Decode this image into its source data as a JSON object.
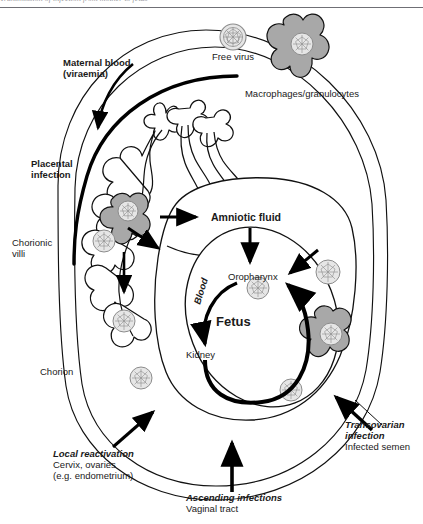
{
  "page": {
    "width": 423,
    "height": 524,
    "background": "#ffffff",
    "cut_off_header_text": "Transmission of infection from mother to fetus",
    "header_rule_color": "#6f6f75"
  },
  "palette": {
    "ink": "#000000",
    "text": "#1a1a1a",
    "cell_gray": "#a8a8a8",
    "virus_gray": "#d9d9d9",
    "virus_mesh": "#8c8c8c",
    "thin_line": "#111111"
  },
  "labels": {
    "free_virus": "Free virus",
    "macrophages": "Macrophages/granulocytes",
    "maternal_blood_l1": "Maternal blood",
    "maternal_blood_l2": "(viraemia)",
    "placental_infection_l1": "Placental",
    "placental_infection_l2": "infection",
    "chorionic_villi_l1": "Chorionic",
    "chorionic_villi_l2": "villi",
    "chorion": "Chorion",
    "amniotic_fluid": "Amniotic fluid",
    "oropharynx": "Oropharynx",
    "fetus": "Fetus",
    "kidney": "Kidney",
    "blood": "Blood",
    "local_reactivation_l1": "Local reactivation",
    "local_reactivation_l2": "Cervix, ovaries",
    "local_reactivation_l3": "(e.g. endometrium)",
    "ascending_l1": "Ascending infections",
    "ascending_l2": "Vaginal tract",
    "transovarian_l1": "Transovarian",
    "transovarian_l2": "infection",
    "transovarian_l3": "Infected semen"
  },
  "icons": {
    "virus": "virus-particle-icon",
    "macrophage": "macrophage-cell-icon",
    "arrow": "arrow-icon"
  },
  "diagram": {
    "type": "biological-pathway-diagram",
    "virus_particles": [
      {
        "id": "free-virus",
        "x": 233,
        "y": 37,
        "r": 13
      },
      {
        "id": "macrophage-virus-top",
        "x": 302,
        "y": 44,
        "r": 11
      },
      {
        "id": "villi-macrophage-virus",
        "x": 128,
        "y": 210,
        "r": 10
      },
      {
        "id": "villi-virus",
        "x": 104,
        "y": 241,
        "r": 11
      },
      {
        "id": "chorion-virus-left",
        "x": 124,
        "y": 321,
        "r": 11
      },
      {
        "id": "chorion-virus-lower-left",
        "x": 141,
        "y": 378,
        "r": 11
      },
      {
        "id": "fetus-virus",
        "x": 258,
        "y": 288,
        "r": 11
      },
      {
        "id": "chorion-virus-right-upper",
        "x": 328,
        "y": 272,
        "r": 12
      },
      {
        "id": "chorion-macrophage-virus-right",
        "x": 331,
        "y": 335,
        "r": 11
      },
      {
        "id": "chorion-virus-right-lower",
        "x": 291,
        "y": 390,
        "r": 11
      }
    ],
    "macrophages": [
      {
        "id": "macrophage-top-right",
        "cx": 303,
        "cy": 47
      },
      {
        "id": "macrophage-villi",
        "cx": 129,
        "cy": 212
      },
      {
        "id": "macrophage-chorion-right",
        "cx": 333,
        "cy": 336
      }
    ],
    "pathways": [
      {
        "name": "maternal-blood-viraemia",
        "label": "Maternal blood (viraemia)",
        "style": "curved-arrow-down-left"
      },
      {
        "name": "placental-infection",
        "label": "Placental infection",
        "style": "label-only"
      },
      {
        "name": "villi-to-amniotic",
        "style": "straight-arrow-right"
      },
      {
        "name": "villi-to-fetus-diagonal",
        "style": "straight-arrow-diagonal"
      },
      {
        "name": "villi-down-into-chorion",
        "style": "straight-arrow-down"
      },
      {
        "name": "amniotic-to-oropharynx",
        "style": "straight-arrow-down"
      },
      {
        "name": "transovarian-to-fetus",
        "style": "straight-arrow-diagonal"
      },
      {
        "name": "fetal-blood-circulation",
        "label": "Blood",
        "style": "thick-curved-loop"
      },
      {
        "name": "local-reactivation",
        "label": "Local reactivation",
        "style": "straight-arrow-up-right"
      },
      {
        "name": "ascending-infections",
        "label": "Ascending infections",
        "style": "straight-arrow-up"
      },
      {
        "name": "transovarian-infection",
        "label": "Transovarian infection",
        "style": "straight-arrow-up-left"
      }
    ]
  }
}
